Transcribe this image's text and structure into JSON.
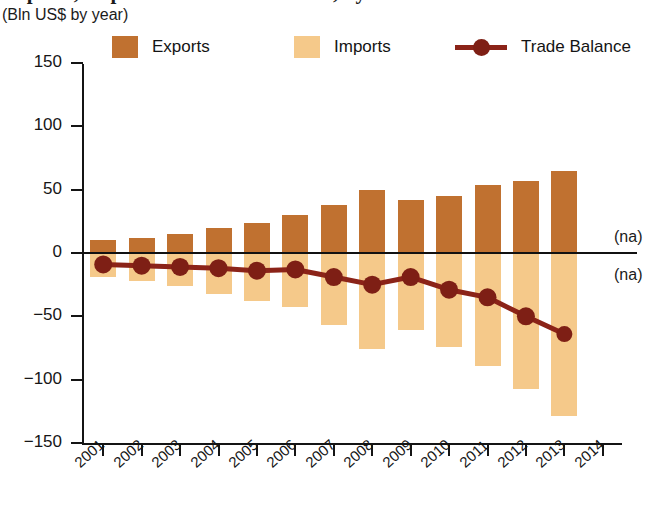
{
  "header": {
    "title": "Exports, Imports and Trade Balance, by Value",
    "subtitle": "(Bln US$ by year)"
  },
  "legend": {
    "items": [
      {
        "label": "Exports",
        "type": "swatch",
        "color": "#C07130"
      },
      {
        "label": "Imports",
        "type": "swatch",
        "color": "#F5C98A"
      },
      {
        "label": "Trade Balance",
        "type": "line",
        "color": "#8B2318"
      }
    ]
  },
  "annotations": {
    "na_above": "(na)",
    "na_below": "(na)"
  },
  "chart_data": {
    "type": "bar",
    "title": "Exports, Imports and Trade Balance, by Value",
    "subtitle": "(Bln US$ by year)",
    "xlabel": "",
    "ylabel": "Bln US$",
    "ylim": [
      -150,
      150
    ],
    "yticks": [
      150,
      100,
      50,
      0,
      -50,
      -100,
      -150
    ],
    "ytick_labels": [
      "150",
      "100",
      "50",
      "0",
      "−50",
      "−100",
      "−150"
    ],
    "categories": [
      "2001",
      "2002",
      "2003",
      "2004",
      "2005",
      "2006",
      "2007",
      "2008",
      "2009",
      "2010",
      "2011",
      "2012",
      "2013",
      "2014"
    ],
    "grid": false,
    "legend_position": "top",
    "series": [
      {
        "name": "Exports",
        "color": "#C07130",
        "values": [
          10,
          12,
          15,
          20,
          24,
          30,
          38,
          50,
          42,
          45,
          54,
          57,
          65,
          null
        ]
      },
      {
        "name": "Imports",
        "color": "#F5C98A",
        "values": [
          -19,
          -22,
          -26,
          -32,
          -38,
          -43,
          -57,
          -76,
          -61,
          -74,
          -89,
          -107,
          -129,
          null
        ]
      },
      {
        "name": "Trade Balance",
        "color": "#8B2318",
        "type": "line",
        "values": [
          -9,
          -10,
          -11,
          -12,
          -14,
          -13,
          -19,
          -25,
          -19,
          -29,
          -35,
          -50,
          -64,
          null
        ]
      }
    ],
    "notes": [
      "2014 Exports value not available (na)",
      "2014 Imports value not available (na)"
    ]
  }
}
